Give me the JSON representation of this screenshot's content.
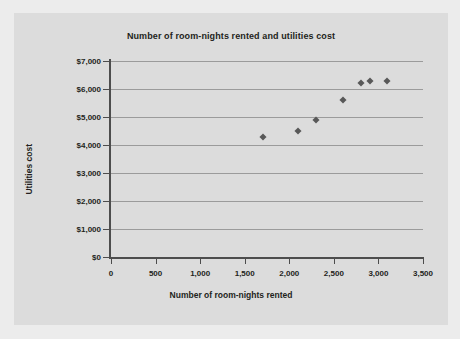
{
  "chart_data": {
    "type": "scatter",
    "title": "Number of room-nights rented and utilities cost",
    "xlabel": "Number of room-nights rented",
    "ylabel": "Utilities cost",
    "xlim": [
      0,
      3500
    ],
    "ylim": [
      0,
      7000
    ],
    "grid": true,
    "legend": null,
    "marker": {
      "shape": "diamond",
      "color": "#585858"
    },
    "x_ticks": [
      0,
      500,
      1000,
      1500,
      2000,
      2500,
      3000,
      3500
    ],
    "x_tick_labels": [
      "0",
      "500",
      "1,000",
      "1,500",
      "2,000",
      "2,500",
      "3,000",
      "3,500"
    ],
    "y_ticks": [
      0,
      1000,
      2000,
      3000,
      4000,
      5000,
      6000,
      7000
    ],
    "y_tick_labels": [
      "$0",
      "$1,000",
      "$2,000",
      "$3,000",
      "$4,000",
      "$5,000",
      "$6,000",
      "$7,000"
    ],
    "x": [
      1700,
      2100,
      2300,
      2600,
      2800,
      2900,
      3100
    ],
    "y": [
      4300,
      4500,
      4900,
      5600,
      6200,
      6300,
      6300
    ],
    "points": [
      {
        "x": 1700,
        "y": 4300
      },
      {
        "x": 2100,
        "y": 4500
      },
      {
        "x": 2300,
        "y": 4900
      },
      {
        "x": 2600,
        "y": 5600
      },
      {
        "x": 2800,
        "y": 6200
      },
      {
        "x": 2900,
        "y": 6300
      },
      {
        "x": 3100,
        "y": 6300
      }
    ]
  },
  "colors": {
    "page_background": "#ececec",
    "panel_background": "#dcdcdc",
    "axis": "#4d4d4d",
    "gridline": "#9b9b9b",
    "text": "#231f20",
    "marker": "#585858"
  }
}
